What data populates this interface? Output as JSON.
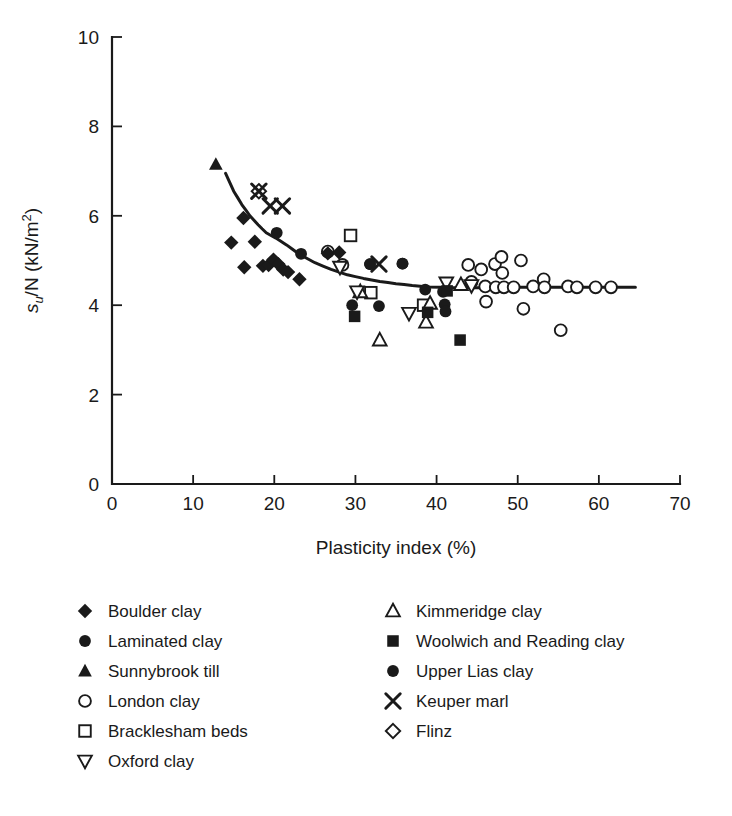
{
  "chart_data": {
    "type": "scatter",
    "title": "",
    "xlabel": "Plasticity index (%)",
    "ylabel": "su/N (kN/m2)",
    "ylabel_parts": {
      "base": "s",
      "sub": "u",
      "mid": "/N (kN/m",
      "sup": "2",
      "close": ")"
    },
    "xlim": [
      0,
      70
    ],
    "ylim": [
      0,
      10
    ],
    "xticks": [
      0,
      10,
      20,
      30,
      40,
      50,
      60,
      70
    ],
    "yticks": [
      0,
      2,
      4,
      6,
      8,
      10
    ],
    "grid": false,
    "legend_position": "below-plot",
    "marker_color": "#1a1a1a",
    "curve_color": "#1a1a1a",
    "series": [
      {
        "name": "Boulder clay",
        "marker": "filled-diamond",
        "points": [
          [
            14.7,
            5.4
          ],
          [
            16.2,
            5.95
          ],
          [
            16.3,
            4.85
          ],
          [
            17.6,
            5.42
          ],
          [
            18.6,
            4.88
          ],
          [
            19.3,
            4.9
          ],
          [
            19.9,
            5.02
          ],
          [
            20.5,
            4.92
          ],
          [
            21.1,
            4.8
          ],
          [
            21.7,
            4.74
          ],
          [
            23.1,
            4.58
          ],
          [
            26.6,
            5.16
          ],
          [
            28.0,
            5.18
          ]
        ]
      },
      {
        "name": "Laminated clay",
        "marker": "filled-circle",
        "points": [
          [
            20.3,
            5.62
          ],
          [
            23.3,
            5.15
          ],
          [
            31.8,
            4.92
          ],
          [
            35.8,
            4.93
          ],
          [
            29.6,
            4.0
          ],
          [
            32.9,
            3.98
          ],
          [
            38.6,
            4.35
          ],
          [
            40.8,
            4.3
          ],
          [
            41.0,
            4.02
          ],
          [
            41.1,
            3.86
          ]
        ]
      },
      {
        "name": "Sunnybrook till",
        "marker": "filled-triangle-up",
        "points": [
          [
            12.8,
            7.15
          ]
        ]
      },
      {
        "name": "London clay",
        "marker": "open-circle",
        "points": [
          [
            26.6,
            5.2
          ],
          [
            28.4,
            4.9
          ],
          [
            45.5,
            4.8
          ],
          [
            46.0,
            4.42
          ],
          [
            46.1,
            4.08
          ],
          [
            47.2,
            4.92
          ],
          [
            47.3,
            4.4
          ],
          [
            48.0,
            5.08
          ],
          [
            48.1,
            4.72
          ],
          [
            48.3,
            4.4
          ],
          [
            49.5,
            4.4
          ],
          [
            50.4,
            5.0
          ],
          [
            50.7,
            3.92
          ],
          [
            51.9,
            4.42
          ],
          [
            53.2,
            4.58
          ],
          [
            53.3,
            4.4
          ],
          [
            55.3,
            3.44
          ],
          [
            56.2,
            4.42
          ],
          [
            57.3,
            4.4
          ],
          [
            59.6,
            4.4
          ],
          [
            61.5,
            4.4
          ],
          [
            44.3,
            4.52
          ],
          [
            43.9,
            4.9
          ]
        ]
      },
      {
        "name": "Bracklesham beds",
        "marker": "open-square",
        "points": [
          [
            29.4,
            5.56
          ],
          [
            31.9,
            4.28
          ],
          [
            38.4,
            4.0
          ]
        ]
      },
      {
        "name": "Oxford clay",
        "marker": "open-triangle-down",
        "points": [
          [
            28.1,
            4.85
          ],
          [
            30.2,
            4.3
          ],
          [
            36.6,
            3.82
          ],
          [
            41.2,
            4.5
          ],
          [
            44.3,
            4.44
          ]
        ]
      },
      {
        "name": "Kimmeridge clay",
        "marker": "open-triangle-up",
        "points": [
          [
            30.6,
            4.3
          ],
          [
            33.0,
            3.22
          ],
          [
            39.2,
            4.04
          ],
          [
            43.0,
            4.46
          ],
          [
            38.7,
            3.62
          ]
        ]
      },
      {
        "name": "Woolwich and Reading clay",
        "marker": "filled-square",
        "points": [
          [
            29.9,
            3.75
          ],
          [
            38.9,
            3.84
          ],
          [
            41.3,
            4.32
          ],
          [
            42.9,
            3.22
          ]
        ]
      },
      {
        "name": "Upper Lias clay",
        "marker": "filled-circle",
        "points": [
          [
            31.8,
            4.92
          ],
          [
            35.8,
            4.93
          ]
        ]
      },
      {
        "name": "Keuper marl",
        "marker": "x-cross",
        "points": [
          [
            19.5,
            6.22
          ],
          [
            21.0,
            6.22
          ],
          [
            18.1,
            6.55
          ],
          [
            32.9,
            4.92
          ]
        ]
      },
      {
        "name": "Flinz",
        "marker": "open-diamond",
        "points": [
          [
            18.1,
            6.55
          ]
        ]
      }
    ],
    "trend_curve": {
      "name": "best-fit curve",
      "points": [
        [
          14.0,
          6.95
        ],
        [
          15.0,
          6.55
        ],
        [
          16.0,
          6.25
        ],
        [
          17.0,
          6.0
        ],
        [
          18.0,
          5.8
        ],
        [
          19.0,
          5.62
        ],
        [
          20.2,
          5.5
        ],
        [
          21.5,
          5.35
        ],
        [
          23.0,
          5.15
        ],
        [
          25.0,
          4.95
        ],
        [
          27.0,
          4.8
        ],
        [
          29.0,
          4.68
        ],
        [
          31.0,
          4.6
        ],
        [
          33.0,
          4.53
        ],
        [
          35.0,
          4.48
        ],
        [
          37.0,
          4.44
        ],
        [
          39.0,
          4.41
        ],
        [
          42.0,
          4.39
        ],
        [
          46.0,
          4.39
        ],
        [
          50.0,
          4.4
        ],
        [
          55.0,
          4.4
        ],
        [
          60.0,
          4.4
        ],
        [
          64.5,
          4.4
        ]
      ]
    }
  },
  "axes": {
    "x_tick_labels": [
      "0",
      "10",
      "20",
      "30",
      "40",
      "50",
      "60",
      "70"
    ],
    "y_tick_labels": [
      "0",
      "2",
      "4",
      "6",
      "8",
      "10"
    ],
    "x_axis_title": "Plasticity index (%)"
  },
  "legend": {
    "left_column": [
      {
        "marker": "filled-diamond",
        "label": "Boulder clay"
      },
      {
        "marker": "filled-circle",
        "label": "Laminated clay"
      },
      {
        "marker": "filled-triangle-up",
        "label": "Sunnybrook till"
      },
      {
        "marker": "open-circle",
        "label": "London clay"
      },
      {
        "marker": "open-square",
        "label": "Bracklesham beds"
      },
      {
        "marker": "open-triangle-down",
        "label": "Oxford clay"
      }
    ],
    "right_column": [
      {
        "marker": "open-triangle-up",
        "label": "Kimmeridge clay"
      },
      {
        "marker": "filled-square",
        "label": "Woolwich and Reading clay"
      },
      {
        "marker": "filled-circle",
        "label": "Upper Lias clay"
      },
      {
        "marker": "x-cross",
        "label": "Keuper marl"
      },
      {
        "marker": "open-diamond",
        "label": "Flinz"
      }
    ]
  }
}
